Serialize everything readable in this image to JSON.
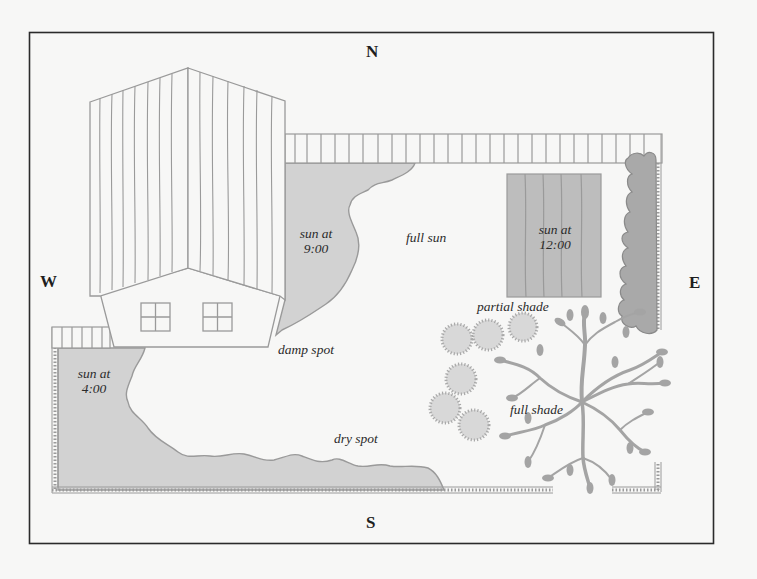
{
  "compass": {
    "north": "N",
    "south": "S",
    "east": "E",
    "west": "W"
  },
  "labels": {
    "sun_9_line1": "sun at",
    "sun_9_line2": "9:00",
    "full_sun": "full sun",
    "sun_12_line1": "sun at",
    "sun_12_line2": "12:00",
    "partial_shade": "partial shade",
    "damp_spot": "damp spot",
    "sun_4_line1": "sun at",
    "sun_4_line2": "4:00",
    "dry_spot": "dry spot",
    "full_shade": "full shade"
  },
  "colors": {
    "background": "#f7f7f6",
    "frame": "#2b2b2b",
    "line": "#9a9a9a",
    "shade_fill": "#d2d2d2",
    "bed_fill": "#bdbdbd",
    "hedge_fill": "#a9a9a9",
    "tree": "#a4a4a4",
    "shrub_fill": "#d8d8d8"
  }
}
